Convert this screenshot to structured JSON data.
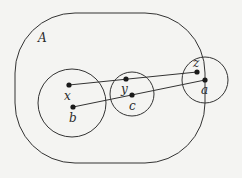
{
  "diagram": {
    "region_label": "A",
    "colors": {
      "stroke": "#333333",
      "background": "#f4f4f2",
      "text": "#2a2a2a"
    },
    "regions": [
      {
        "id": "A",
        "shape": "rounded-rect",
        "x": 15,
        "y": 13,
        "width": 190,
        "height": 150,
        "rx": 60
      }
    ],
    "circles": [
      {
        "id": "left",
        "cx": 72,
        "cy": 103,
        "r": 34,
        "contains": [
          "x",
          "b"
        ]
      },
      {
        "id": "middle",
        "cx": 132,
        "cy": 94,
        "r": 22,
        "contains": [
          "y",
          "c"
        ]
      },
      {
        "id": "right",
        "cx": 205,
        "cy": 80,
        "r": 23,
        "contains": [
          "z",
          "a"
        ]
      }
    ],
    "points": [
      {
        "id": "x",
        "label": "x",
        "cx": 69,
        "cy": 85,
        "lx": 64,
        "ly": 100
      },
      {
        "id": "b",
        "label": "b",
        "cx": 73,
        "cy": 107,
        "lx": 69,
        "ly": 122
      },
      {
        "id": "y",
        "label": "y",
        "cx": 126,
        "cy": 79,
        "lx": 121,
        "ly": 93
      },
      {
        "id": "c",
        "label": "c",
        "cx": 132,
        "cy": 95,
        "lx": 129,
        "ly": 110
      },
      {
        "id": "z",
        "label": "z",
        "cx": 197,
        "cy": 72,
        "lx": 193,
        "ly": 67
      },
      {
        "id": "a",
        "label": "a",
        "cx": 205,
        "cy": 80,
        "lx": 201,
        "ly": 94
      }
    ],
    "edges": [
      {
        "from": "x",
        "to": "z"
      },
      {
        "from": "b",
        "to": "a"
      }
    ]
  }
}
